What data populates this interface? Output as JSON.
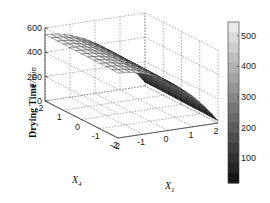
{
  "chart_data": {
    "type": "surface",
    "title": "",
    "zlabel": "Drying Time",
    "zlabel_unit": "T/min",
    "xlabel": "X1",
    "ylabel": "X4",
    "x_ticks": [
      "-2",
      "-1",
      "0",
      "1",
      "2"
    ],
    "y_ticks": [
      "-2",
      "-1",
      "0",
      "1",
      "2"
    ],
    "z_ticks": [
      "0",
      "200",
      "400",
      "600"
    ],
    "zlim": [
      0,
      600
    ],
    "xlim": [
      -2,
      2
    ],
    "ylim": [
      -2,
      2
    ],
    "grid": true,
    "colormap": "gray",
    "colorbar": {
      "ticks": [
        "100",
        "200",
        "300",
        "400",
        "500"
      ],
      "range": [
        20,
        545
      ]
    },
    "x": [
      -2,
      -1.5,
      -1,
      -0.5,
      0,
      0.5,
      1,
      1.5,
      2
    ],
    "y": [
      -2,
      -1,
      0,
      1,
      2
    ],
    "z_profile_along_x1": [
      540,
      530,
      505,
      465,
      410,
      340,
      255,
      150,
      25
    ],
    "note": "Surface nearly constant along X4; decreases with X1 from ~540 at X1=-2 to ~25 at X1=2"
  }
}
